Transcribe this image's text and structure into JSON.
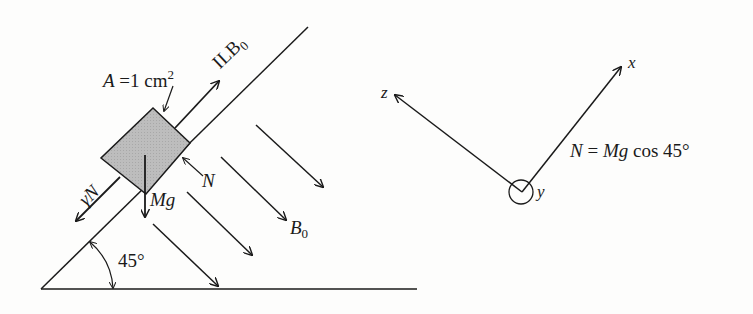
{
  "diagram": {
    "left_panel": {
      "area_label": {
        "var": "A",
        "eq": "=1 cm",
        "exp": "2"
      },
      "force_along_incline_up": {
        "text": "ILB",
        "sub": "0"
      },
      "friction_force": {
        "text": "γN"
      },
      "normal_force": {
        "text": "N"
      },
      "weight": {
        "text": "Mg"
      },
      "magnetic_field": {
        "text": "B",
        "sub": "0"
      },
      "incline_angle": {
        "text": "45°"
      }
    },
    "right_panel": {
      "axis_x": {
        "text": "x"
      },
      "axis_z": {
        "text": "z"
      },
      "axis_y": {
        "text": "y",
        "direction": "out-of-page"
      },
      "equation": {
        "lhs": "N",
        "eq": " = ",
        "rhs_var": "Mg",
        "rhs_rest": " cos 45°"
      }
    },
    "colors": {
      "ink": "#1a1a1a",
      "block_fill": "#b9b9b9",
      "background": "#fdfdfc"
    }
  }
}
